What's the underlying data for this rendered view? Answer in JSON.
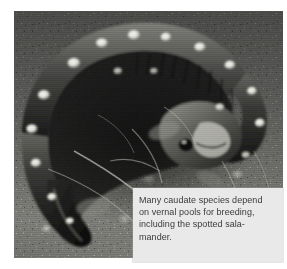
{
  "figure": {
    "name": "spotted-salamander-photo-figure",
    "photo": {
      "alt_description": "Black and white photograph of a coiled spotted salamander resting on mossy ground, its dark body marked with pale round spots along the back and tail",
      "subject": "spotted salamander",
      "treatment": "black-and-white",
      "colors": {
        "ground_dark": "#4a4a48",
        "ground_mid": "#6e6e6a",
        "ground_light": "#b6b6b0",
        "body_dark": "#1d1d1c",
        "body_mid": "#4b4b49",
        "spot_light": "#e4e4de",
        "highlight": "#f2f2ec"
      }
    },
    "caption": {
      "text": "Many caudate species depend on vernal pools for breeding, including the spotted sala-mander.",
      "lines": [
        "Many caudate species depend",
        "on vernal pools for breeding,",
        "including the spotted sala-",
        "mander."
      ],
      "background_color": "#e9e9e9",
      "text_color": "#3a3a3a"
    }
  }
}
